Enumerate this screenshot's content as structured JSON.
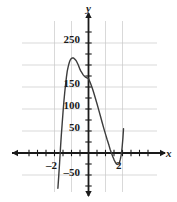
{
  "chart_data": {
    "type": "line",
    "title": "",
    "xlabel": "x",
    "ylabel": "y",
    "xlim": [
      -3.85,
      4.15
    ],
    "ylim": [
      -75,
      275
    ],
    "grid": true,
    "grid_step_x": 2,
    "grid_step_y": 50,
    "tick_step_x": 1,
    "tick_step_y": 25,
    "legend": "none",
    "x_tick_labels": [
      {
        "value": -2,
        "text": "–2"
      },
      {
        "value": 2,
        "text": "2"
      }
    ],
    "y_tick_labels": [
      {
        "value": 250,
        "text": "250"
      },
      {
        "value": 150,
        "text": "150"
      },
      {
        "value": 100,
        "text": "100"
      },
      {
        "value": 50,
        "text": "50"
      },
      {
        "value": -50,
        "text": "–50"
      }
    ],
    "series": [
      {
        "name": "curve",
        "color": "#3c3c3c",
        "points": [
          [
            -3.6,
            -80
          ],
          [
            -3.5,
            -52
          ],
          [
            -3.4,
            -22
          ],
          [
            -3.3,
            10
          ],
          [
            -3.2,
            40
          ],
          [
            -3.1,
            66
          ],
          [
            -3.0,
            92
          ],
          [
            -2.9,
            116
          ],
          [
            -2.8,
            137
          ],
          [
            -2.7,
            155
          ],
          [
            -2.6,
            172
          ],
          [
            -2.5,
            186
          ],
          [
            -2.4,
            195
          ],
          [
            -2.3,
            203
          ],
          [
            -2.2,
            209
          ],
          [
            -2.1,
            213
          ],
          [
            -2.0,
            215
          ],
          [
            -1.9,
            216
          ],
          [
            -1.8,
            216
          ],
          [
            -1.7,
            215
          ],
          [
            -1.6,
            213
          ],
          [
            -1.5,
            211
          ],
          [
            -1.4,
            208
          ],
          [
            -1.3,
            204
          ],
          [
            -1.2,
            200
          ],
          [
            -1.1,
            195
          ],
          [
            -1.0,
            190
          ],
          [
            -0.9,
            186
          ],
          [
            -0.8,
            183
          ],
          [
            -0.7,
            180
          ],
          [
            -0.6,
            177
          ],
          [
            -0.5,
            175
          ],
          [
            -0.4,
            173
          ],
          [
            -0.3,
            172
          ],
          [
            -0.2,
            171
          ],
          [
            -0.1,
            170
          ],
          [
            0.0,
            169
          ],
          [
            0.2,
            160
          ],
          [
            0.4,
            150
          ],
          [
            0.6,
            138
          ],
          [
            0.8,
            125
          ],
          [
            1.0,
            112
          ],
          [
            1.2,
            98
          ],
          [
            1.4,
            84
          ],
          [
            1.6,
            70
          ],
          [
            1.8,
            56
          ],
          [
            2.0,
            43
          ],
          [
            2.2,
            30
          ],
          [
            2.4,
            18
          ],
          [
            2.55,
            8
          ],
          [
            2.7,
            0
          ],
          [
            2.85,
            -8
          ],
          [
            3.0,
            -15
          ],
          [
            3.15,
            -21
          ],
          [
            3.3,
            -25
          ],
          [
            3.45,
            -26
          ],
          [
            3.55,
            -25
          ],
          [
            3.65,
            -21
          ],
          [
            3.75,
            -14
          ],
          [
            3.85,
            -4
          ],
          [
            3.95,
            12
          ],
          [
            4.05,
            34
          ],
          [
            4.12,
            55
          ]
        ]
      }
    ]
  },
  "axes": {
    "x_axis_label": "x",
    "y_axis_label": "y"
  }
}
